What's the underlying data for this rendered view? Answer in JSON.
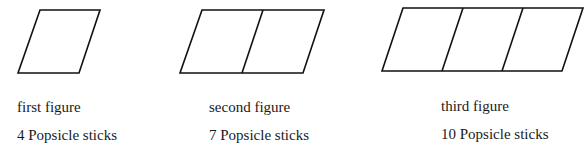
{
  "figures": [
    {
      "name": "first figure",
      "sticks": "4 Popsicle sticks",
      "squares": 1
    },
    {
      "name": "second figure",
      "sticks": "7 Popsicle sticks",
      "squares": 2
    },
    {
      "name": "third figure",
      "sticks": "10 Popsicle sticks",
      "squares": 3
    }
  ],
  "colors": {
    "stroke": "#111111",
    "text": "#1a1a1a",
    "background": "#ffffff"
  }
}
